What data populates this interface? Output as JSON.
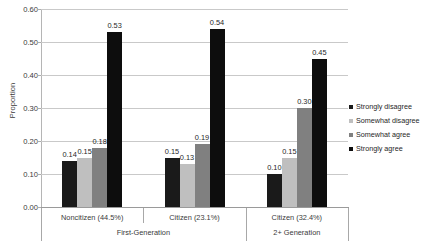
{
  "chart_data": {
    "type": "bar",
    "title": "",
    "xlabel": "",
    "ylabel": "Proportion",
    "ylim": [
      0.0,
      0.6
    ],
    "ytick_labels": [
      "0.00",
      "0.10",
      "0.20",
      "0.30",
      "0.40",
      "0.50",
      "0.60"
    ],
    "ytick_values": [
      0.0,
      0.1,
      0.2,
      0.3,
      0.4,
      0.5,
      0.6
    ],
    "grid": "horizontal",
    "legend_position": "right",
    "categories": [
      "Noncitizen (44.5%)",
      "Citizen (23.1%)",
      "Citizen (32.4%)"
    ],
    "category_groups": [
      {
        "label": "First-Generation",
        "categories": [
          "Noncitizen (44.5%)",
          "Citizen (23.1%)"
        ]
      },
      {
        "label": "2+ Generation",
        "categories": [
          "Citizen (32.4%)"
        ]
      }
    ],
    "series": [
      {
        "name": "Strongly disagree",
        "color": "#1a1a1a",
        "values": [
          0.14,
          0.15,
          0.1
        ],
        "labels": [
          "0.14",
          "0.15",
          "0.10"
        ]
      },
      {
        "name": "Somewhat disagree",
        "color": "#bfbfbf",
        "values": [
          0.15,
          0.13,
          0.15
        ],
        "labels": [
          "0.15",
          "0.13",
          "0.15"
        ]
      },
      {
        "name": "Somewhat agree",
        "color": "#808080",
        "values": [
          0.18,
          0.19,
          0.3
        ],
        "labels": [
          "0.18",
          "0.19",
          "0.30"
        ]
      },
      {
        "name": "Strongly agree",
        "color": "#0d0d0d",
        "values": [
          0.53,
          0.54,
          0.45
        ],
        "labels": [
          "0.53",
          "0.54",
          "0.45"
        ]
      }
    ]
  },
  "legend": {
    "items": [
      {
        "label": "Strongly disagree",
        "color": "#1a1a1a"
      },
      {
        "label": "Somewhat disagree",
        "color": "#bfbfbf"
      },
      {
        "label": "Somewhat agree",
        "color": "#808080"
      },
      {
        "label": "Strongly agree",
        "color": "#0d0d0d"
      }
    ]
  }
}
